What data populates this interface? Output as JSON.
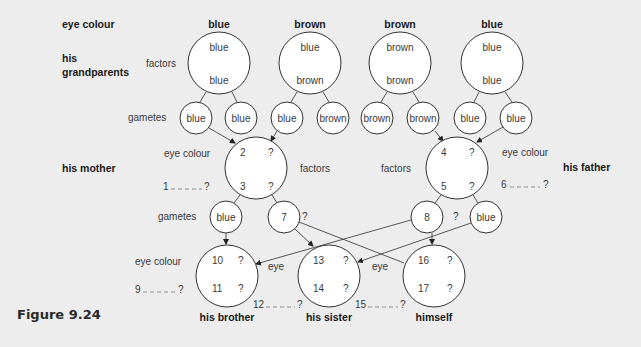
{
  "figure": {
    "caption": "Figure 9.24"
  },
  "row_labels": {
    "eye_colour": "eye colour",
    "grandparents": [
      "his",
      "grandparents"
    ],
    "mother": "his mother",
    "father": "his father",
    "factors": "factors",
    "gametes": "gametes",
    "eye": "eye"
  },
  "grandparents": [
    {
      "eye_colour": "blue",
      "factor_top": "blue",
      "factor_bottom": "blue",
      "gametes": [
        "blue",
        "blue"
      ]
    },
    {
      "eye_colour": "brown",
      "factor_top": "blue",
      "factor_bottom": "brown",
      "gametes": [
        "blue",
        "brown"
      ]
    },
    {
      "eye_colour": "brown",
      "factor_top": "brown",
      "factor_bottom": "brown",
      "gametes": [
        "brown",
        "brown"
      ]
    },
    {
      "eye_colour": "blue",
      "factor_top": "blue",
      "factor_bottom": "blue",
      "gametes": [
        "blue",
        "blue"
      ]
    }
  ],
  "mother": {
    "top_left": "2",
    "top_right": "?",
    "bottom_left": "3",
    "bottom_right": "?",
    "eye_colour_blank": "1",
    "blank_end": "?",
    "gametes": [
      "blue",
      "7"
    ],
    "gamete_q": "?"
  },
  "father": {
    "top_left": "4",
    "top_right": "?",
    "bottom_left": "5",
    "bottom_right": "?",
    "eye_colour_blank": "6",
    "blank_end": "?",
    "gametes": [
      "8",
      "blue"
    ],
    "gamete_q": "?"
  },
  "children": [
    {
      "name": "his brother",
      "top_left": "10",
      "top_right": "?",
      "bottom_left": "11",
      "bottom_right": "?",
      "blank_num": "9",
      "blank_end": "?"
    },
    {
      "name": "his sister",
      "top_left": "13",
      "top_right": "?",
      "bottom_left": "14",
      "bottom_right": "?",
      "blank_num": "12",
      "blank_end": "?"
    },
    {
      "name": "himself",
      "top_left": "16",
      "top_right": "?",
      "bottom_left": "17",
      "bottom_right": "?",
      "blank_num": "15",
      "blank_end": "?"
    }
  ]
}
